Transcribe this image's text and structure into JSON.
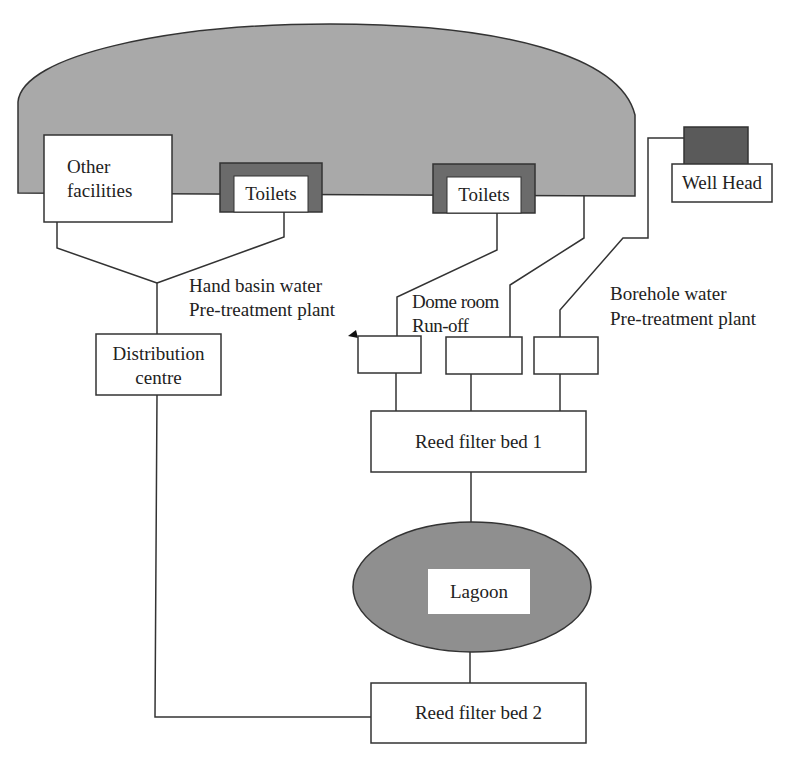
{
  "diagram": {
    "type": "water treatment flow diagram",
    "nodes": {
      "dome": {
        "label": ""
      },
      "other_facilities": {
        "label_line1": "Other",
        "label_line2": "facilities"
      },
      "toilets_1": {
        "label": "Toilets"
      },
      "toilets_2": {
        "label": "Toilets"
      },
      "well_head": {
        "label": "Well Head"
      },
      "distribution_centre": {
        "label_line1": "Distribution",
        "label_line2": "centre"
      },
      "hand_basin_plant": {
        "label_line1": "Hand basin water",
        "label_line2": "Pre-treatment plant"
      },
      "dome_runoff": {
        "label_line1": "Dome room",
        "label_line2": "Run-off"
      },
      "borehole_plant": {
        "label_line1": "Borehole water",
        "label_line2": "Pre-treatment plant"
      },
      "reed_bed_1": {
        "label": "Reed filter bed 1"
      },
      "lagoon": {
        "label": "Lagoon"
      },
      "reed_bed_2": {
        "label": "Reed filter bed 2"
      }
    },
    "edges": [
      [
        "other_facilities",
        "distribution_centre"
      ],
      [
        "toilets_1",
        "distribution_centre"
      ],
      [
        "distribution_centre",
        "reed_bed_2"
      ],
      [
        "toilets_2",
        "hand_basin_plant_box"
      ],
      [
        "dome",
        "dome_runoff_box"
      ],
      [
        "well_head",
        "borehole_plant_box"
      ],
      [
        "hand_basin_plant_box",
        "reed_bed_1"
      ],
      [
        "dome_runoff_box",
        "reed_bed_1"
      ],
      [
        "borehole_plant_box",
        "reed_bed_1"
      ],
      [
        "reed_bed_1",
        "lagoon"
      ],
      [
        "lagoon",
        "reed_bed_2"
      ]
    ],
    "colors": {
      "dome_fill": "#a9a9a9",
      "dark_fill": "#6b6b6b",
      "lagoon_fill": "#8f8f8f",
      "line": "#333333"
    }
  }
}
